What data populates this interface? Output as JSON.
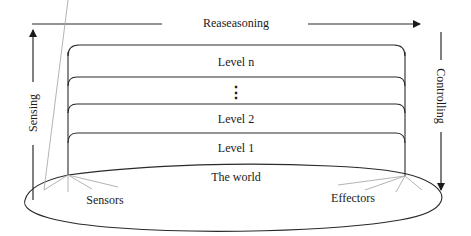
{
  "diagram": {
    "top_label": "Reaseasoning",
    "left_label": "Sensing",
    "right_label": "Controlling",
    "levels": [
      {
        "label": "Level n"
      },
      {
        "label": "⋮"
      },
      {
        "label": "Level 2"
      },
      {
        "label": "Level 1"
      }
    ],
    "world_label": "The world",
    "sensors_label": "Sensors",
    "effectors_label": "Effectors",
    "colors": {
      "line": "#2a2a2a",
      "fan": "#aaaaaa",
      "background": "#ffffff"
    }
  }
}
